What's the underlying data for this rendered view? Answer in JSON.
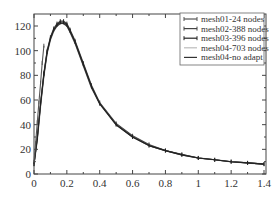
{
  "chart_data": {
    "type": "line",
    "title": "",
    "xlabel": "",
    "ylabel": "",
    "xlim": [
      0,
      1.4
    ],
    "ylim": [
      0,
      130
    ],
    "grid": false,
    "legend_position": "upper right",
    "x_ticks": [
      "0",
      "0.2",
      "0.4",
      "0.6",
      "0.8",
      "1",
      "1.2",
      "1.4"
    ],
    "y_ticks": [
      "0",
      "20",
      "40",
      "60",
      "80",
      "100",
      "120"
    ],
    "series": [
      {
        "name": "mesh01-24 nodes",
        "color": "#555555",
        "marker": "tick",
        "x": [
          0.0,
          0.01,
          0.02,
          0.03,
          0.04,
          0.05,
          0.06
        ],
        "y": [
          10,
          25,
          42,
          58,
          74,
          90,
          104
        ]
      },
      {
        "name": "mesh02-388 nodes",
        "color": "#444444",
        "marker": "tick",
        "x": [
          0.0,
          0.02,
          0.04,
          0.06,
          0.08,
          0.1,
          0.12,
          0.14,
          0.16,
          0.18,
          0.2,
          0.22,
          0.25,
          0.3,
          0.35,
          0.4,
          0.5,
          0.6,
          0.7,
          0.8,
          0.9,
          1.0,
          1.1,
          1.2,
          1.3,
          1.4
        ],
        "y": [
          8,
          30,
          58,
          82,
          100,
          111,
          118,
          122,
          124,
          124,
          122,
          117,
          108,
          90,
          72,
          58,
          41,
          31,
          24,
          19,
          16,
          13,
          11.5,
          10,
          9,
          8
        ]
      },
      {
        "name": "mesh03-396 nodes",
        "color": "#222222",
        "marker": "tick",
        "x": [
          0.0,
          0.02,
          0.04,
          0.06,
          0.08,
          0.1,
          0.12,
          0.14,
          0.16,
          0.18,
          0.2,
          0.22,
          0.25,
          0.3,
          0.35,
          0.4,
          0.5,
          0.6,
          0.7,
          0.8,
          0.9,
          1.0,
          1.1,
          1.2,
          1.3,
          1.4
        ],
        "y": [
          8,
          29,
          57,
          81,
          99,
          110,
          117,
          121,
          123,
          123,
          121,
          116,
          107,
          89,
          71,
          57,
          40,
          30,
          23,
          19,
          15.5,
          13,
          11.5,
          10,
          9,
          8
        ]
      },
      {
        "name": "mesh04-703 nodes",
        "color": "#bbbbbb",
        "marker": "none",
        "x": [
          0.0,
          0.02,
          0.04,
          0.06,
          0.08,
          0.1,
          0.12,
          0.14,
          0.16,
          0.18,
          0.2,
          0.22,
          0.25,
          0.3,
          0.35,
          0.4,
          0.5,
          0.6,
          0.7,
          0.8,
          0.9,
          1.0,
          1.1,
          1.2,
          1.3,
          1.4
        ],
        "y": [
          8,
          28,
          56,
          80,
          98,
          109,
          116,
          120,
          122,
          122,
          120,
          115,
          106,
          88,
          70,
          57,
          40,
          30,
          23,
          19,
          15.5,
          13,
          11.5,
          10,
          9,
          8
        ]
      },
      {
        "name": "mesh04-no adapt",
        "color": "#333333",
        "marker": "none",
        "x": [
          0.0,
          0.02,
          0.04,
          0.06,
          0.08,
          0.1,
          0.12,
          0.14,
          0.16,
          0.18,
          0.2,
          0.22,
          0.25,
          0.3,
          0.35,
          0.4,
          0.5,
          0.6,
          0.7,
          0.8,
          0.9,
          1.0,
          1.1,
          1.2,
          1.3,
          1.4
        ],
        "y": [
          8,
          28,
          56,
          80,
          98,
          109,
          116,
          120,
          122,
          122,
          120,
          115,
          106,
          88,
          70,
          57,
          40,
          30,
          23,
          19,
          15.5,
          13,
          11.5,
          10,
          9,
          8
        ]
      }
    ]
  }
}
